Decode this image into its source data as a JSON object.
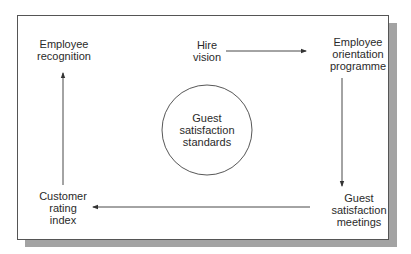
{
  "diagram": {
    "type": "cycle-flow",
    "center": {
      "lines": [
        "Guest",
        "satisfaction",
        "standards"
      ]
    },
    "nodes": [
      {
        "id": "hire-vision",
        "lines": [
          "Hire",
          "vision"
        ]
      },
      {
        "id": "employee-orientation-programme",
        "lines": [
          "Employee",
          "orientation",
          "programme"
        ]
      },
      {
        "id": "guest-satisfaction-meetings",
        "lines": [
          "Guest",
          "satisfaction",
          "meetings"
        ]
      },
      {
        "id": "customer-rating-index",
        "lines": [
          "Customer",
          "rating",
          "index"
        ]
      },
      {
        "id": "employee-recognition",
        "lines": [
          "Employee",
          "recognition"
        ]
      }
    ],
    "edges": [
      {
        "from": "hire-vision",
        "to": "employee-orientation-programme"
      },
      {
        "from": "employee-orientation-programme",
        "to": "guest-satisfaction-meetings"
      },
      {
        "from": "guest-satisfaction-meetings",
        "to": "customer-rating-index"
      },
      {
        "from": "customer-rating-index",
        "to": "employee-recognition"
      }
    ],
    "colors": {
      "frame_border": "#555555",
      "shadow": "#a3a3a3",
      "line": "#333333",
      "text": "#2a2a2a"
    }
  }
}
